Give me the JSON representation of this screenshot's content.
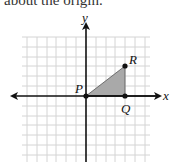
{
  "caption": "about the origin.",
  "diagram": {
    "type": "coordinate-plane",
    "grid": {
      "spacing_px": 9.8,
      "x_range": [
        -6,
        6
      ],
      "y_range": [
        -6,
        6
      ],
      "color": "#cfcfcf"
    },
    "axes": {
      "x_label": "x",
      "y_label": "y",
      "color": "#111111"
    },
    "points": [
      {
        "name": "P",
        "x": 0,
        "y": 0
      },
      {
        "name": "Q",
        "x": 4,
        "y": 0
      },
      {
        "name": "R",
        "x": 4,
        "y": 3
      }
    ],
    "triangle": {
      "vertices": [
        "P",
        "Q",
        "R"
      ],
      "fill": "#a9a9a9"
    }
  },
  "labels": {
    "P": "P",
    "Q": "Q",
    "R": "R",
    "x": "x",
    "y": "y"
  }
}
